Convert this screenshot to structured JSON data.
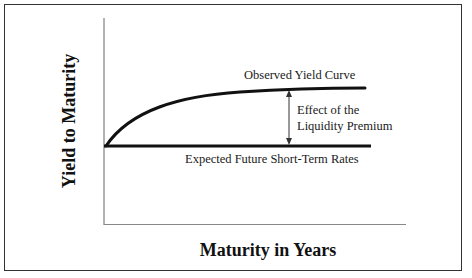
{
  "diagram": {
    "type": "yield-curve-liquidity-premium",
    "y_axis_title": "Yield to Maturity",
    "x_axis_title": "Maturity in Years",
    "curves": {
      "observed": {
        "label": "Observed Yield Curve",
        "shape": "concave rising curve"
      },
      "expected": {
        "label": "Expected Future Short-Term Rates",
        "shape": "horizontal line"
      }
    },
    "annotation": {
      "line1": "Effect of the",
      "line2": "Liquidity Premium",
      "marker": "double-headed-vertical-arrow"
    },
    "colors": {
      "lines": "#111111",
      "axes": "#555555",
      "frame": "#333333",
      "background": "#ffffff"
    }
  }
}
